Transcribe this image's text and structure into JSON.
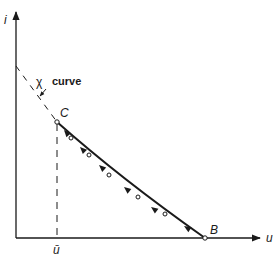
{
  "diagram": {
    "axes": {
      "y_label": "i",
      "x_label": "u",
      "origin": [
        16,
        238
      ],
      "y_top": 10,
      "x_right": 262
    },
    "points": {
      "C": {
        "label": "C",
        "x": 57,
        "y": 122
      },
      "B": {
        "label": "B",
        "x": 205,
        "y": 238
      }
    },
    "u_bar_label": "ū",
    "chi_curve": {
      "symbol": "χ",
      "word": "curve",
      "label": "χ curve",
      "start": [
        16,
        66
      ],
      "end": [
        57,
        122
      ]
    },
    "curve_markers": [
      [
        57,
        122
      ],
      [
        71,
        138
      ],
      [
        89,
        155
      ],
      [
        109,
        176
      ],
      [
        138,
        198
      ],
      [
        165,
        216
      ],
      [
        205,
        238
      ]
    ],
    "curve_arrows": [
      {
        "at": [
          64,
          130
        ],
        "direction": "toward C"
      },
      {
        "at": [
          80,
          147
        ],
        "direction": "toward C"
      },
      {
        "at": [
          99,
          165
        ],
        "direction": "toward C"
      },
      {
        "at": [
          124,
          187
        ],
        "direction": "toward C"
      },
      {
        "at": [
          151,
          207
        ],
        "direction": "toward C"
      },
      {
        "at": [
          184,
          226
        ],
        "direction": "toward C"
      }
    ],
    "colors": {
      "ink": "#1a1a1a",
      "background": "#ffffff"
    }
  }
}
